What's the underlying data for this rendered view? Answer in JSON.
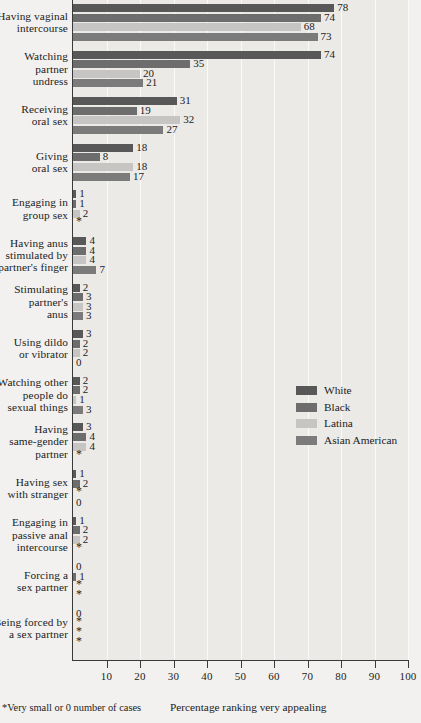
{
  "chart_data": {
    "type": "bar",
    "orientation": "horizontal",
    "title": "",
    "xlabel": "Percentage ranking very appealing",
    "ylabel": "",
    "xlim": [
      0,
      100
    ],
    "xticks": [
      10,
      20,
      30,
      40,
      50,
      60,
      70,
      80,
      90,
      100
    ],
    "grid": true,
    "legend_position": "middle-right",
    "footnote": "*Very small or 0 number of cases",
    "missing_marker": "*",
    "series": [
      {
        "name": "White",
        "color": "#585858",
        "values": [
          78,
          74,
          31,
          18,
          1,
          4,
          2,
          3,
          2,
          3,
          1,
          1,
          0,
          0
        ]
      },
      {
        "name": "Black",
        "color": "#6d6d6d",
        "values": [
          74,
          35,
          19,
          8,
          1,
          4,
          3,
          2,
          2,
          4,
          2,
          2,
          1,
          null
        ]
      },
      {
        "name": "Latina",
        "color": "#c6c5c3",
        "values": [
          68,
          20,
          32,
          18,
          2,
          4,
          3,
          2,
          1,
          4,
          null,
          2,
          null,
          null
        ]
      },
      {
        "name": "Asian American",
        "color": "#7b7b7b",
        "values": [
          73,
          21,
          27,
          17,
          null,
          7,
          3,
          0,
          3,
          null,
          0,
          null,
          null,
          null
        ]
      }
    ],
    "categories": [
      "Having vaginal intercourse",
      "Watching partner undress",
      "Receiving oral sex",
      "Giving oral sex",
      "Engaging in group sex",
      "Having anus stimulated by partner's finger",
      "Stimulating partner's anus",
      "Using dildo or vibrator",
      "Watching other people do sexual things",
      "Having same-gender partner",
      "Having sex with stranger",
      "Engaging in passive anal intercourse",
      "Forcing a sex partner",
      "Being forced by a sex partner"
    ],
    "category_lines": [
      [
        "Having vaginal",
        "intercourse"
      ],
      [
        "Watching",
        "partner",
        "undress"
      ],
      [
        "Receiving",
        "oral sex"
      ],
      [
        "Giving",
        "oral sex"
      ],
      [
        "Engaging in",
        "group sex"
      ],
      [
        "Having anus",
        "stimulated by",
        "partner's finger"
      ],
      [
        "Stimulating",
        "partner's",
        "anus"
      ],
      [
        "Using dildo",
        "or vibrator"
      ],
      [
        "Watching other",
        "people do",
        "sexual things"
      ],
      [
        "Having",
        "same-gender",
        "partner"
      ],
      [
        "Having sex",
        "with stranger"
      ],
      [
        "Engaging in",
        "passive anal",
        "intercourse"
      ],
      [
        "Forcing a",
        "sex partner"
      ],
      [
        "Being forced by",
        "a sex partner"
      ]
    ]
  },
  "legend": {
    "items": [
      {
        "label": "White",
        "color": "#585858"
      },
      {
        "label": "Black",
        "color": "#6d6d6d"
      },
      {
        "label": "Latina",
        "color": "#c6c5c3"
      },
      {
        "label": "Asian American",
        "color": "#7b7b7b"
      }
    ]
  },
  "axis": {
    "tick_labels": [
      "10",
      "20",
      "30",
      "40",
      "50",
      "60",
      "70",
      "80",
      "90",
      "100"
    ],
    "x_axis_title": "Percentage ranking very appealing"
  },
  "footer": {
    "footnote": "*Very small or 0 number of cases"
  }
}
